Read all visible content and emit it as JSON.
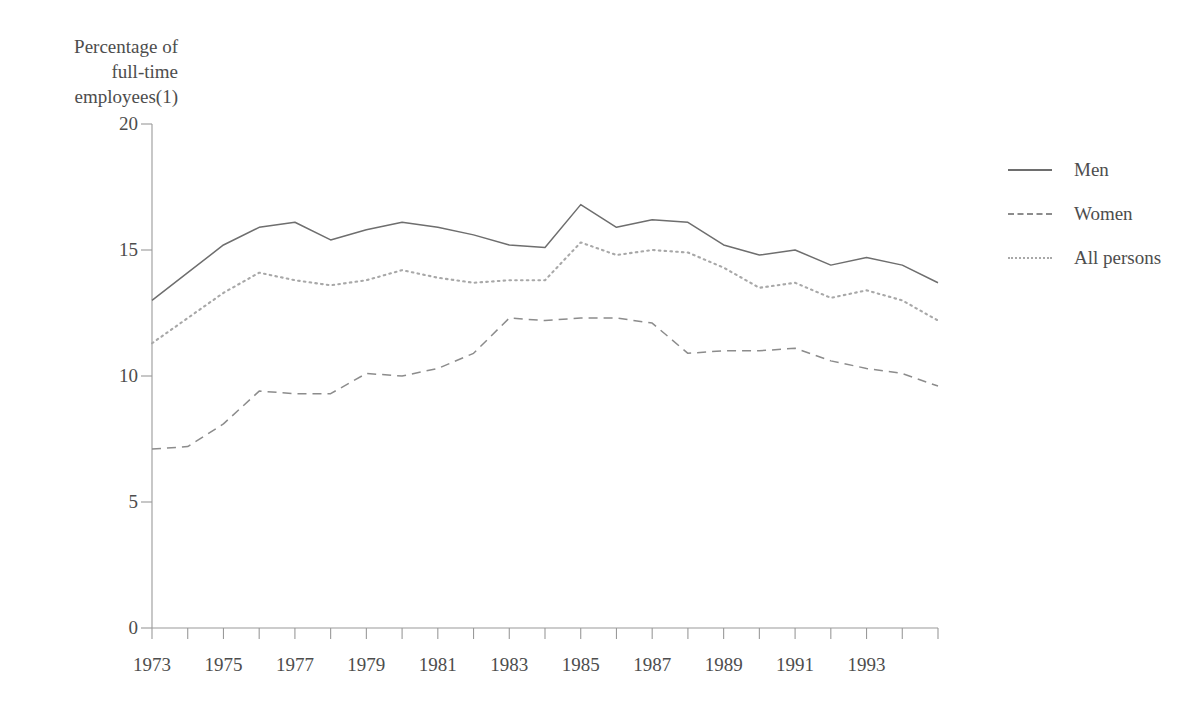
{
  "chart_data": {
    "type": "line",
    "title": "",
    "ylabel": "Percentage of\nfull-time\nemployees(1)",
    "xlabel": "",
    "ylim": [
      0,
      20
    ],
    "yticks": [
      0,
      5,
      10,
      15,
      20
    ],
    "ytick_labels": [
      "0",
      "5",
      "10",
      "15",
      "20"
    ],
    "xlim": [
      1973,
      1995
    ],
    "x": [
      1973,
      1974,
      1975,
      1976,
      1977,
      1978,
      1979,
      1980,
      1981,
      1982,
      1983,
      1984,
      1985,
      1986,
      1987,
      1988,
      1989,
      1990,
      1991,
      1992,
      1993,
      1994,
      1995
    ],
    "xtick_labels": [
      "1973",
      "",
      "1975",
      "",
      "1977",
      "",
      "1979",
      "",
      "1981",
      "",
      "1983",
      "",
      "1985",
      "",
      "1987",
      "",
      "1989",
      "",
      "1991",
      "",
      "1993",
      "",
      ""
    ],
    "xtick_labels_shown": [
      "1973",
      "1975",
      "1977",
      "1979",
      "1981",
      "1983",
      "1985",
      "1987",
      "1989",
      "1991",
      "1993"
    ],
    "grid": false,
    "legend_position": "right",
    "series": [
      {
        "name": "Men",
        "style": "solid",
        "color": "#6e6e6e",
        "values": [
          13.0,
          14.1,
          15.2,
          15.9,
          16.1,
          15.4,
          15.8,
          16.1,
          15.9,
          15.6,
          15.2,
          15.1,
          16.8,
          15.9,
          16.2,
          16.1,
          15.2,
          14.8,
          15.0,
          14.4,
          14.7,
          14.4,
          13.7
        ]
      },
      {
        "name": "Women",
        "style": "dashed",
        "color": "#8c8c8c",
        "values": [
          7.1,
          7.2,
          8.1,
          9.4,
          9.3,
          9.3,
          10.1,
          10.0,
          10.3,
          10.9,
          12.3,
          12.2,
          12.3,
          12.3,
          12.1,
          10.9,
          11.0,
          11.0,
          11.1,
          10.6,
          10.3,
          10.1,
          9.6
        ]
      },
      {
        "name": "All persons",
        "style": "dotted",
        "color": "#a8a8a8",
        "values": [
          11.3,
          12.3,
          13.3,
          14.1,
          13.8,
          13.6,
          13.8,
          14.2,
          13.9,
          13.7,
          13.8,
          13.8,
          15.3,
          14.8,
          15.0,
          14.9,
          14.3,
          13.5,
          13.7,
          13.1,
          13.4,
          13.0,
          12.2
        ]
      }
    ]
  },
  "legend": {
    "items": [
      {
        "label": "Men",
        "style": "solid"
      },
      {
        "label": "Women",
        "style": "dashed"
      },
      {
        "label": "All persons",
        "style": "dotted"
      }
    ]
  },
  "colors": {
    "axis": "#9a9a9a",
    "text": "#4d4d4d",
    "background": "#ffffff"
  }
}
